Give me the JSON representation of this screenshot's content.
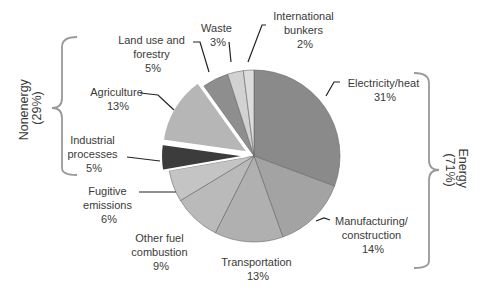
{
  "chart_data": {
    "type": "pie",
    "title": "",
    "slices": [
      {
        "label": "Electricity/heat",
        "value": 31,
        "group": "Energy",
        "color": "#8a8a8a",
        "exploded": false
      },
      {
        "label": "Manufacturing/ construction",
        "value": 14,
        "group": "Energy",
        "color": "#a3a3a3",
        "exploded": false
      },
      {
        "label": "Transportation",
        "value": 13,
        "group": "Energy",
        "color": "#b0b0b0",
        "exploded": false
      },
      {
        "label": "Other fuel combustion",
        "value": 9,
        "group": "Energy",
        "color": "#bababa",
        "exploded": false
      },
      {
        "label": "Fugitive emissions",
        "value": 6,
        "group": "Energy",
        "color": "#c4c4c4",
        "exploded": false
      },
      {
        "label": "Industrial processes",
        "value": 5,
        "group": "Nonenergy",
        "color": "#3c3c3c",
        "exploded": true
      },
      {
        "label": "Agriculture",
        "value": 13,
        "group": "Nonenergy",
        "color": "#b6b6b6",
        "exploded": true
      },
      {
        "label": "Land use and forestry",
        "value": 5,
        "group": "Nonenergy",
        "color": "#8e8e8e",
        "exploded": false
      },
      {
        "label": "Waste",
        "value": 3,
        "group": "Nonenergy",
        "color": "#d2d2d2",
        "exploded": false
      },
      {
        "label": "International bunkers",
        "value": 2,
        "group": "Energy",
        "color": "#dcdcdc",
        "exploded": false
      }
    ],
    "groups": [
      {
        "label": "Energy",
        "value": 71
      },
      {
        "label": "Nonenergy",
        "value": 29
      }
    ],
    "legend": "none"
  },
  "labels": {
    "electricity": [
      "Electricity/heat",
      "31%"
    ],
    "manufacturing": [
      "Manufacturing/",
      "construction",
      "14%"
    ],
    "transportation": [
      "Transportation",
      "13%"
    ],
    "other_fuel": [
      "Other fuel",
      "combustion",
      "9%"
    ],
    "fugitive": [
      "Fugitive",
      "emissions",
      "6%"
    ],
    "industrial": [
      "Industrial",
      "processes",
      "5%"
    ],
    "agriculture": [
      "Agriculture",
      "13%"
    ],
    "land_use": [
      "Land use and",
      "forestry",
      "5%"
    ],
    "waste": [
      "Waste",
      "3%"
    ],
    "bunkers": [
      "International",
      "bunkers",
      "2%"
    ]
  },
  "brackets": {
    "nonenergy": [
      "Nonenergy",
      "(29%)"
    ],
    "energy": [
      "Energy",
      "(71%)"
    ]
  }
}
